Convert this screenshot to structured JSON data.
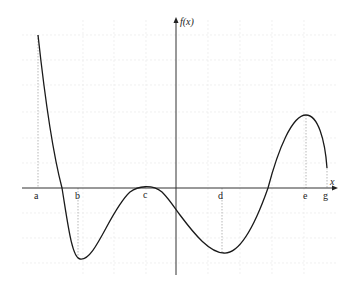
{
  "graph": {
    "function_label": "f(x)",
    "x_axis_label": "x",
    "points": [
      {
        "name": "a",
        "x": 38
      },
      {
        "name": "b",
        "x": 78
      },
      {
        "name": "c",
        "x": 146
      },
      {
        "name": "d",
        "x": 222
      },
      {
        "name": "e",
        "x": 306
      },
      {
        "name": "g",
        "x": 327
      }
    ],
    "colors": {
      "curve": "#1a1a1a",
      "axis": "#333333",
      "grid": "#e4e4e4",
      "dotted": "#999999"
    }
  }
}
